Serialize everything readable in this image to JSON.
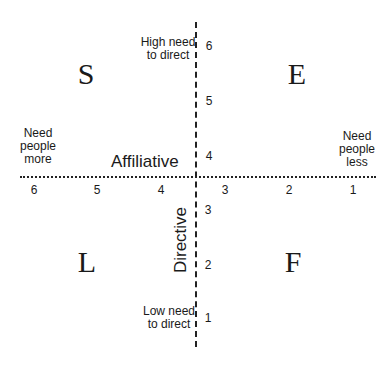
{
  "diagram": {
    "quadrants": {
      "top_left": "S",
      "top_right": "E",
      "bottom_left": "L",
      "bottom_right": "F"
    },
    "horizontal_axis": {
      "title": "Affiliative",
      "ticks": [
        "6",
        "5",
        "4",
        "3",
        "2",
        "1"
      ],
      "left_note": "Need people more",
      "right_note": "Need people less"
    },
    "vertical_axis": {
      "title": "Directive",
      "ticks_upper": [
        "6",
        "5",
        "4"
      ],
      "ticks_lower": [
        "3",
        "2",
        "1"
      ],
      "top_note": "High need to direct",
      "bottom_note": "Low need to direct"
    }
  }
}
